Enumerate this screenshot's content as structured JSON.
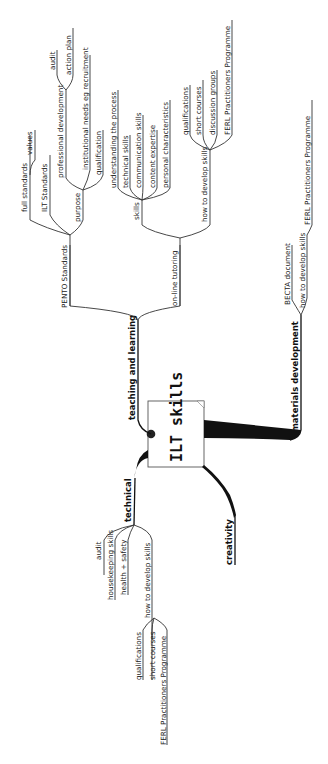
{
  "center": {
    "label": "ILT skills"
  },
  "branches": {
    "teaching": {
      "label": "teaching and learning",
      "pento": {
        "label": "PENTO Standards",
        "full": "full standards",
        "values": "values",
        "ilt": "ILT Standards",
        "purpose": {
          "label": "purpose",
          "profdev": "professional development",
          "audit": "audit",
          "action": "action plan",
          "institutional": "institutional needs eg recruitment",
          "qualification": "qualification"
        }
      },
      "online": {
        "label": "on-line tutoring",
        "skills": {
          "label": "skills",
          "items": [
            "understanding the process",
            "technical skills",
            "communication skills",
            "content expertise",
            "personal characteristics"
          ]
        },
        "howto": {
          "label": "how to develop skills",
          "items": [
            "qualifications",
            "short courses",
            "discussion groups",
            "FERL Practitioners Programme"
          ]
        }
      }
    },
    "materials": {
      "label": "materials development",
      "becta": "BECTA document",
      "howto": {
        "label": "how to develop skills",
        "ferl": "FERL Practitioners Programme"
      }
    },
    "technical": {
      "label": "technical",
      "audit": "audit",
      "housekeeping": "housekeeping skills",
      "health": "health + safety",
      "howto": {
        "label": "how to develop skills",
        "items": [
          "qualifications",
          "short courses",
          "FERL Practitioners Programme"
        ]
      }
    },
    "creativity": {
      "label": "creativity"
    }
  }
}
